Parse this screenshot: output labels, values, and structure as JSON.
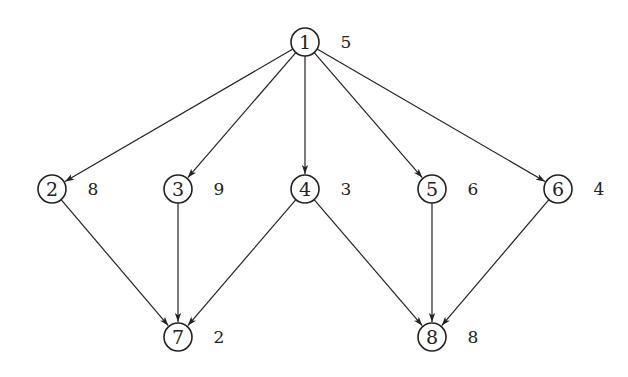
{
  "diagram": {
    "type": "directed-acyclic-graph",
    "style": {
      "stroke_color": "#222222",
      "text_color": "#222222",
      "background": "#ffffff",
      "node_radius": 14
    },
    "nodes": [
      {
        "id": "1",
        "label": "1",
        "weight": "5",
        "x": 305,
        "y": 42
      },
      {
        "id": "2",
        "label": "2",
        "weight": "8",
        "x": 52,
        "y": 189
      },
      {
        "id": "3",
        "label": "3",
        "weight": "9",
        "x": 178,
        "y": 189
      },
      {
        "id": "4",
        "label": "4",
        "weight": "3",
        "x": 305,
        "y": 189
      },
      {
        "id": "5",
        "label": "5",
        "weight": "6",
        "x": 432,
        "y": 189
      },
      {
        "id": "6",
        "label": "6",
        "weight": "4",
        "x": 558,
        "y": 189
      },
      {
        "id": "7",
        "label": "7",
        "weight": "2",
        "x": 178,
        "y": 337
      },
      {
        "id": "8",
        "label": "8",
        "weight": "8",
        "x": 432,
        "y": 337
      }
    ],
    "edges": [
      {
        "from": "1",
        "to": "2"
      },
      {
        "from": "1",
        "to": "3"
      },
      {
        "from": "1",
        "to": "4"
      },
      {
        "from": "1",
        "to": "5"
      },
      {
        "from": "1",
        "to": "6"
      },
      {
        "from": "2",
        "to": "7"
      },
      {
        "from": "3",
        "to": "7"
      },
      {
        "from": "4",
        "to": "7"
      },
      {
        "from": "4",
        "to": "8"
      },
      {
        "from": "5",
        "to": "8"
      },
      {
        "from": "6",
        "to": "8"
      }
    ]
  }
}
